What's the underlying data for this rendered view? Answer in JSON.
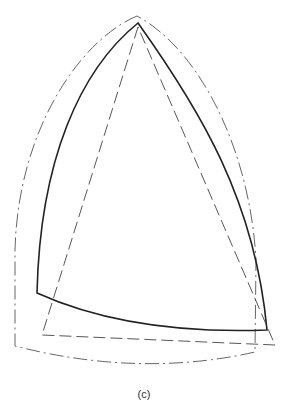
{
  "figure": {
    "caption": "(c)",
    "shapes": [
      {
        "name": "outer-boundary",
        "style": "dash-dot",
        "color": "#555555"
      },
      {
        "name": "curved-triangle",
        "style": "solid",
        "color": "#222222"
      },
      {
        "name": "straight-triangle",
        "style": "dashed",
        "color": "#444444"
      }
    ]
  }
}
